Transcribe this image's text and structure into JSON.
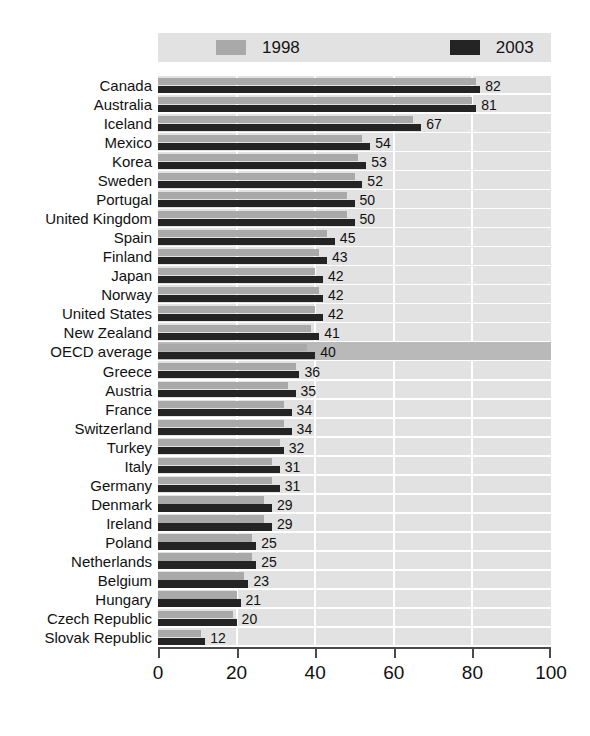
{
  "chart_data": {
    "type": "bar",
    "orientation": "horizontal",
    "title": "",
    "subtitle": "",
    "xlabel": "",
    "ylabel": "",
    "xlim": [
      0,
      100
    ],
    "xticks": [
      0,
      20,
      40,
      60,
      80,
      100
    ],
    "grid": "vertical-white",
    "legend_position": "top",
    "highlight_category": "OECD average",
    "colors": {
      "series_1998": "#a9a9a9",
      "series_2003": "#242424",
      "plot_background": "#e2e2e2",
      "highlight_row": "#b9b9b9",
      "gridline": "#ffffff",
      "axis": "#4a4a4a",
      "text": "#111111"
    },
    "categories": [
      "Canada",
      "Australia",
      "Iceland",
      "Mexico",
      "Korea",
      "Sweden",
      "Portugal",
      "United Kingdom",
      "Spain",
      "Finland",
      "Japan",
      "Norway",
      "United States",
      "New Zealand",
      "OECD average",
      "Greece",
      "Austria",
      "France",
      "Switzerland",
      "Turkey",
      "Italy",
      "Germany",
      "Denmark",
      "Ireland",
      "Poland",
      "Netherlands",
      "Belgium",
      "Hungary",
      "Czech Republic",
      "Slovak Republic"
    ],
    "series": [
      {
        "name": "1998",
        "values": [
          81,
          80,
          65,
          52,
          51,
          50,
          48,
          48,
          43,
          41,
          40,
          41,
          40,
          39,
          38,
          35,
          33,
          32,
          32,
          31,
          29,
          29,
          27,
          27,
          24,
          24,
          22,
          20,
          19,
          11
        ]
      },
      {
        "name": "2003",
        "values": [
          82,
          81,
          67,
          54,
          53,
          52,
          50,
          50,
          45,
          43,
          42,
          42,
          42,
          41,
          40,
          36,
          35,
          34,
          34,
          32,
          31,
          31,
          29,
          29,
          25,
          25,
          23,
          21,
          20,
          12
        ]
      }
    ],
    "data_labels": [
      82,
      81,
      67,
      54,
      53,
      52,
      50,
      50,
      45,
      43,
      42,
      42,
      42,
      41,
      40,
      36,
      35,
      34,
      34,
      32,
      31,
      31,
      29,
      29,
      25,
      25,
      23,
      21,
      20,
      12
    ]
  },
  "legend": {
    "entries": [
      {
        "label": "1998",
        "color": "#a9a9a9",
        "swatch_name": "legend-swatch-1998"
      },
      {
        "label": "2003",
        "color": "#242424",
        "swatch_name": "legend-swatch-2003"
      }
    ]
  },
  "axis": {
    "x_tick_labels": [
      "0",
      "20",
      "40",
      "60",
      "80",
      "100"
    ]
  }
}
